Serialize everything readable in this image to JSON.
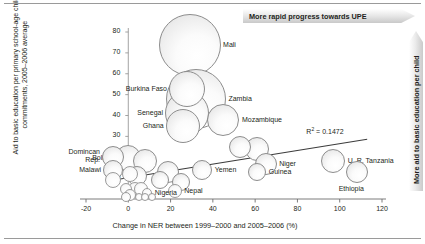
{
  "banners": {
    "top": "More rapid progress towards UPE",
    "right": "More aid to basic education per child"
  },
  "axes": {
    "ylabel": "Aid to basic education per primary school-age child, commitments, 2005–2006 average",
    "xlabel": "Change in NER between 1999–2000 and 2005–2006 (%)",
    "yticks": [
      "80",
      "70",
      "60",
      "50",
      "40",
      "30",
      "20",
      "10"
    ],
    "xticks": [
      "-20",
      "0",
      "20",
      "40",
      "60",
      "80",
      "100",
      "120"
    ]
  },
  "annotations": {
    "r2_prefix": "R",
    "r2_sup": "2",
    "r2_value": " = 0.1472"
  },
  "chart_data": {
    "type": "scatter",
    "title": "",
    "xlabel": "Change in NER between 1999–2000 and 2005–2006 (%)",
    "ylabel": "Aid to basic education per primary school-age child, commitments, 2005–2006 average",
    "xlim": [
      -20,
      120
    ],
    "ylim": [
      0,
      80
    ],
    "grid": false,
    "legend": false,
    "r_squared": 0.1472,
    "trendline": {
      "x0": -6,
      "y0": 9.2,
      "x1": 113,
      "y1": 28.6
    },
    "size_encoding": "bubble area proportional to aid volume",
    "points": [
      {
        "label": "Mali",
        "x": 29,
        "y": 74,
        "size": 31,
        "label_pos": "right"
      },
      {
        "label": "Zambia",
        "x": 32,
        "y": 48,
        "size": 30,
        "label_pos": "right"
      },
      {
        "label": "Burkina Faso",
        "x": 28,
        "y": 52.5,
        "size": 18,
        "label_pos": "left"
      },
      {
        "label": "Senegal",
        "x": 28,
        "y": 41,
        "size": 22,
        "label_pos": "left"
      },
      {
        "label": "Ghana",
        "x": 26,
        "y": 35,
        "size": 17,
        "label_pos": "left"
      },
      {
        "label": "Mozambique",
        "x": 45,
        "y": 38,
        "size": 16,
        "label_pos": "right"
      },
      {
        "label": "Domincan Rep.",
        "x": -7,
        "y": 20,
        "size": 11,
        "label_pos": "left"
      },
      {
        "label": "Bolivia",
        "x": 0,
        "y": 19.5,
        "size": 13,
        "label_pos": "left"
      },
      {
        "label": "Malawi",
        "x": -7,
        "y": 14,
        "size": 10,
        "label_pos": "left"
      },
      {
        "label": "Yemen",
        "x": 35,
        "y": 14,
        "size": 10,
        "label_pos": "right"
      },
      {
        "label": "Niger",
        "x": 65,
        "y": 17,
        "size": 11,
        "label_pos": "right"
      },
      {
        "label": "Guinea",
        "x": 61,
        "y": 13,
        "size": 9,
        "label_pos": "right"
      },
      {
        "label": "U. R. Tanzania",
        "x": 97,
        "y": 18,
        "size": 12,
        "label_pos": "right"
      },
      {
        "label": "Ethiopia",
        "x": 108,
        "y": 13,
        "size": 11,
        "label_pos": "below"
      },
      {
        "label": "Nigeria",
        "x": 9,
        "y": 3,
        "size": 5,
        "label_pos": "right"
      },
      {
        "label": "Nepal",
        "x": 22,
        "y": 4,
        "size": 7,
        "label_pos": "right"
      },
      {
        "label": "",
        "x": 8,
        "y": 18,
        "size": 12,
        "label_pos": "none"
      },
      {
        "label": "",
        "x": 4,
        "y": 11,
        "size": 10,
        "label_pos": "none"
      },
      {
        "label": "",
        "x": 1,
        "y": 12,
        "size": 8,
        "label_pos": "none"
      },
      {
        "label": "",
        "x": 15,
        "y": 9,
        "size": 9,
        "label_pos": "none"
      },
      {
        "label": "",
        "x": 19,
        "y": 13,
        "size": 11,
        "label_pos": "none"
      },
      {
        "label": "",
        "x": 25,
        "y": 8,
        "size": 9,
        "label_pos": "none"
      },
      {
        "label": "",
        "x": 53,
        "y": 25,
        "size": 11,
        "label_pos": "none"
      },
      {
        "label": "",
        "x": 61,
        "y": 24,
        "size": 12,
        "label_pos": "none"
      },
      {
        "label": "",
        "x": -7,
        "y": 9,
        "size": 8,
        "label_pos": "none"
      },
      {
        "label": "",
        "x": -1,
        "y": 5,
        "size": 6,
        "label_pos": "none"
      },
      {
        "label": "",
        "x": 3,
        "y": 5,
        "size": 7,
        "label_pos": "none"
      },
      {
        "label": "",
        "x": 6,
        "y": 5,
        "size": 7,
        "label_pos": "none"
      },
      {
        "label": "",
        "x": 1,
        "y": 2,
        "size": 6,
        "label_pos": "none"
      },
      {
        "label": "",
        "x": -1,
        "y": 1,
        "size": 5,
        "label_pos": "none"
      },
      {
        "label": "",
        "x": 5,
        "y": 1,
        "size": 4,
        "label_pos": "none"
      },
      {
        "label": "",
        "x": 8,
        "y": 1,
        "size": 4,
        "label_pos": "none"
      },
      {
        "label": "",
        "x": 11,
        "y": 1,
        "size": 4,
        "label_pos": "none"
      }
    ]
  }
}
